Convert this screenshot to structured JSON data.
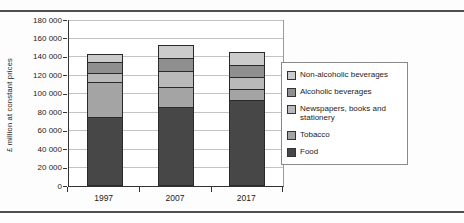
{
  "page": {
    "background": "#fdfdfd",
    "rule_color": "#4f4f4f"
  },
  "chart_data": {
    "type": "bar",
    "stacked": true,
    "title": "",
    "xlabel": "",
    "ylabel": "£ million at constant prices",
    "categories": [
      "1997",
      "2007",
      "2017"
    ],
    "series": [
      {
        "name": "Food",
        "color": "#474747",
        "values": [
          75000,
          86000,
          93000
        ]
      },
      {
        "name": "Tobacco",
        "color": "#a4a4a4",
        "values": [
          39000,
          23000,
          13000
        ]
      },
      {
        "name": "Newspapers, books and stationery",
        "color": "#b9b9b9",
        "values": [
          11000,
          18000,
          14000
        ]
      },
      {
        "name": "Alcoholic beverages",
        "color": "#8f8f8f",
        "values": [
          13000,
          15000,
          15000
        ]
      },
      {
        "name": "Non-alcoholic beverages",
        "color": "#cbcbcb",
        "values": [
          10000,
          15000,
          15000
        ]
      }
    ],
    "totals": [
      148000,
      157000,
      150000
    ],
    "ylim": [
      0,
      180000
    ],
    "ytick_interval": 20000,
    "ytick_labels": [
      "0",
      "20 000",
      "40 000",
      "60 000",
      "80 000",
      "100 000",
      "120 000",
      "140 000",
      "160 000",
      "180 000"
    ],
    "grid": true,
    "legend_position": "right",
    "legend_order": [
      "Non-alcoholic beverages",
      "Alcoholic beverages",
      "Newspapers, books and stationery",
      "Tobacco",
      "Food"
    ]
  }
}
